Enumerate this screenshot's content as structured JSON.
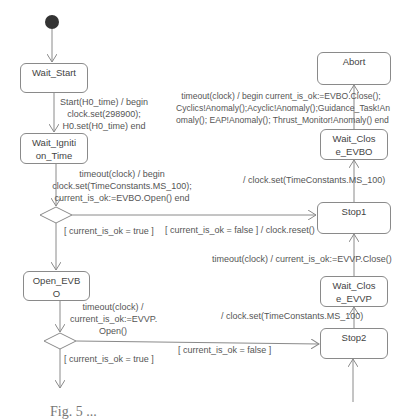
{
  "diagram": {
    "type": "uml-state-machine",
    "colors": {
      "line": "#8a8a8a",
      "text": "#555555",
      "initial_node": "#333333"
    },
    "states": [
      {
        "id": "wait_start",
        "label_lines": [
          "Wait_Start"
        ]
      },
      {
        "id": "wait_ignition",
        "label_lines": [
          "Wait_Igniti",
          "on_Time"
        ]
      },
      {
        "id": "open_evbo",
        "label_lines": [
          "Open_EVB",
          "O"
        ]
      },
      {
        "id": "abort",
        "label_lines": [
          "Abort"
        ]
      },
      {
        "id": "wait_close_evbo",
        "label_lines": [
          "Wait_Clos",
          "e_EVBO"
        ]
      },
      {
        "id": "stop1",
        "label_lines": [
          "Stop1"
        ]
      },
      {
        "id": "wait_close_evvp",
        "label_lines": [
          "Wait_Clos",
          "e_EVVP"
        ]
      },
      {
        "id": "stop2",
        "label_lines": [
          "Stop2"
        ]
      }
    ],
    "transitions": [
      {
        "id": "t_start",
        "lines": [
          "Start(H0_time) / begin",
          "clock.set(298900);",
          "H0.set(H0_time) end"
        ]
      },
      {
        "id": "t_ignite",
        "lines": [
          "timeout(clock) / begin",
          "clock.set(TimeConstants.MS_100);",
          "current_is_ok:=EVBO.Open() end"
        ]
      },
      {
        "id": "t_guard1_true",
        "lines": [
          "[ current_is_ok = true ]"
        ]
      },
      {
        "id": "t_guard1_false",
        "lines": [
          "[ current_is_ok = false ] / clock.reset()"
        ]
      },
      {
        "id": "t_open_evvp",
        "lines": [
          "timeout(clock) /",
          "current_is_ok:=EVVP.",
          "Open()"
        ]
      },
      {
        "id": "t_guard2_true",
        "lines": [
          "[ current_is_ok = true ]"
        ]
      },
      {
        "id": "t_guard2_false",
        "lines": [
          "[ current_is_ok = false ]"
        ]
      },
      {
        "id": "t_abort",
        "lines": [
          "timeout(clock) / begin current_is_ok:=EVBO.Close();",
          "Cyclics!Anomaly();Acyclic!Anomaly();Guidance_Task!An",
          "omaly(); EAP!Anomaly(); Thrust_Monitor!Anomaly() end"
        ]
      },
      {
        "id": "t_stop1_set",
        "lines": [
          "/ clock.set(TimeConstants.MS_100)"
        ]
      },
      {
        "id": "t_close_evvp",
        "lines": [
          "timeout(clock) / current_is_ok:=EVVP.Close()"
        ]
      },
      {
        "id": "t_stop2_set",
        "lines": [
          "/ clock.set(TimeConstants.MS_100)"
        ]
      }
    ],
    "caption": "Fig. 5 ..."
  }
}
